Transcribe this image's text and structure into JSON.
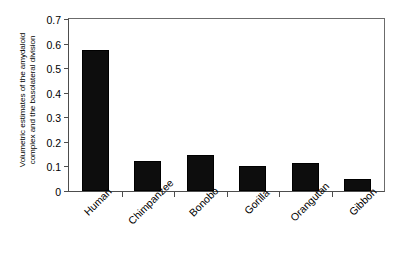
{
  "chart_data": {
    "type": "bar",
    "title": "",
    "xlabel": "",
    "ylabel_lines": [
      "Volumetric estimates of the amydaloid",
      "complex and the basolateral division"
    ],
    "ylabel": "Volumetric estimates of the amydaloid complex and the basolateral division",
    "categories": [
      "Human",
      "Chimpanzee",
      "Bonobo",
      "Gorilla",
      "Orangutan",
      "Gibbon"
    ],
    "values": [
      0.575,
      0.123,
      0.147,
      0.1,
      0.113,
      0.048
    ],
    "ylim": [
      0,
      0.7
    ],
    "ytick_values": [
      0,
      0.1,
      0.2,
      0.3,
      0.4,
      0.5,
      0.6,
      0.7
    ],
    "ytick_labels": [
      "0",
      "0.1",
      "0.2",
      "0.3",
      "0.4",
      "0.5",
      "0.6",
      "0.7"
    ],
    "grid": false,
    "legend": null,
    "bar_color": "#0d0d0d",
    "frame_color": "#4d4d4d",
    "background": "#ffffff"
  }
}
